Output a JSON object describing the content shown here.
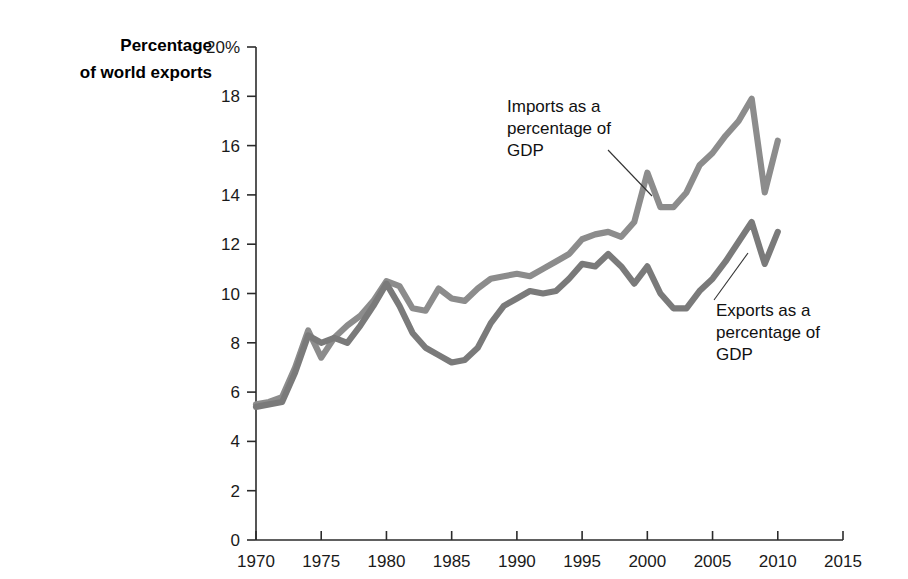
{
  "axis_title": {
    "line1": "Percentage",
    "line2": "of world exports"
  },
  "chart_data": {
    "type": "line",
    "title": "",
    "subtitle": "",
    "xlabel": "",
    "ylabel": "Percentage of world exports",
    "xlim": [
      1970,
      2015
    ],
    "ylim": [
      0,
      20
    ],
    "grid": false,
    "legend_position": "inline-annotations",
    "x_ticks": [
      1970,
      1975,
      1980,
      1985,
      1990,
      1995,
      2000,
      2005,
      2010,
      2015
    ],
    "x_tick_labels": [
      "1970",
      "1975",
      "1980",
      "1985",
      "1990",
      "1995",
      "2000",
      "2005",
      "2010",
      "2015"
    ],
    "y_ticks": [
      0,
      2,
      4,
      6,
      8,
      10,
      12,
      14,
      16,
      18,
      20
    ],
    "y_tick_labels": [
      "0",
      "2",
      "4",
      "6",
      "8",
      "10",
      "12",
      "14",
      "16",
      "18",
      "20%"
    ],
    "x": [
      1970,
      1971,
      1972,
      1973,
      1974,
      1975,
      1976,
      1977,
      1978,
      1979,
      1980,
      1981,
      1982,
      1983,
      1984,
      1985,
      1986,
      1987,
      1988,
      1989,
      1990,
      1991,
      1992,
      1993,
      1994,
      1995,
      1996,
      1997,
      1998,
      1999,
      2000,
      2001,
      2002,
      2003,
      2004,
      2005,
      2006,
      2007,
      2008,
      2009,
      2010
    ],
    "series": [
      {
        "name": "Imports as a percentage of GDP",
        "color": "#8c8c8c",
        "values": [
          5.5,
          5.6,
          5.8,
          7.0,
          8.5,
          7.4,
          8.2,
          8.7,
          9.1,
          9.7,
          10.5,
          10.3,
          9.4,
          9.3,
          10.2,
          9.8,
          9.7,
          10.2,
          10.6,
          10.7,
          10.8,
          10.7,
          11.0,
          11.3,
          11.6,
          12.2,
          12.4,
          12.5,
          12.3,
          12.9,
          14.9,
          13.5,
          13.5,
          14.1,
          15.2,
          15.7,
          16.4,
          17.0,
          17.9,
          14.1,
          16.2
        ]
      },
      {
        "name": "Exports as a percentage of GDP",
        "color": "#7a7a7a",
        "values": [
          5.4,
          5.5,
          5.6,
          6.8,
          8.3,
          8.0,
          8.2,
          8.0,
          8.7,
          9.5,
          10.4,
          9.5,
          8.4,
          7.8,
          7.5,
          7.2,
          7.3,
          7.8,
          8.8,
          9.5,
          9.8,
          10.1,
          10.0,
          10.1,
          10.6,
          11.2,
          11.1,
          11.6,
          11.1,
          10.4,
          11.1,
          10.0,
          9.4,
          9.4,
          10.1,
          10.6,
          11.3,
          12.1,
          12.9,
          11.2,
          12.5
        ]
      }
    ],
    "annotations": [
      {
        "text_lines": [
          "Imports as a",
          "percentage of",
          "GDP"
        ],
        "points_to_year": 2000,
        "points_to_value": 14.9
      },
      {
        "text_lines": [
          "Exports as a",
          "percentage of",
          "GDP"
        ],
        "points_to_year": 2006,
        "points_to_value": 11.3
      }
    ]
  }
}
